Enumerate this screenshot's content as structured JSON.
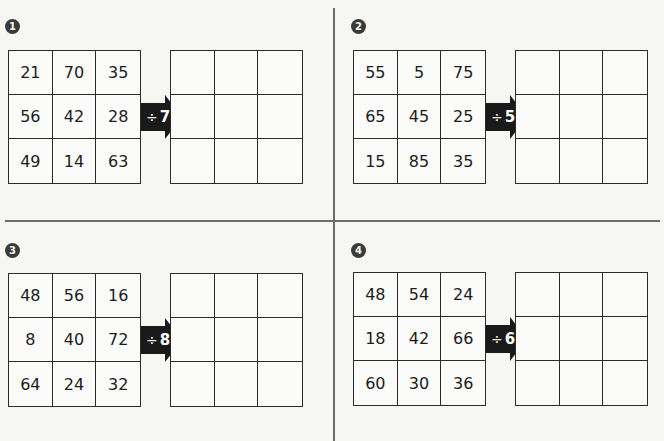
{
  "page": {
    "top_heading_fragment": ""
  },
  "colors": {
    "background": "#f6f6f3",
    "grid_line": "#2b2b2b",
    "badge": "#3a3a3a",
    "arrow": "#1a1a1a",
    "divider": "#6d6d6d"
  },
  "exercises": [
    {
      "number": "1",
      "operator": "÷",
      "divisor": "7",
      "input_grid": [
        [
          "21",
          "70",
          "35"
        ],
        [
          "56",
          "42",
          "28"
        ],
        [
          "49",
          "14",
          "63"
        ]
      ],
      "answer_grid": [
        [
          "",
          "",
          ""
        ],
        [
          "",
          "",
          ""
        ],
        [
          "",
          "",
          ""
        ]
      ]
    },
    {
      "number": "2",
      "operator": "÷",
      "divisor": "5",
      "input_grid": [
        [
          "55",
          "5",
          "75"
        ],
        [
          "65",
          "45",
          "25"
        ],
        [
          "15",
          "85",
          "35"
        ]
      ],
      "answer_grid": [
        [
          "",
          "",
          ""
        ],
        [
          "",
          "",
          ""
        ],
        [
          "",
          "",
          ""
        ]
      ]
    },
    {
      "number": "3",
      "operator": "÷",
      "divisor": "8",
      "input_grid": [
        [
          "48",
          "56",
          "16"
        ],
        [
          "8",
          "40",
          "72"
        ],
        [
          "64",
          "24",
          "32"
        ]
      ],
      "answer_grid": [
        [
          "",
          "",
          ""
        ],
        [
          "",
          "",
          ""
        ],
        [
          "",
          "",
          ""
        ]
      ]
    },
    {
      "number": "4",
      "operator": "÷",
      "divisor": "6",
      "input_grid": [
        [
          "48",
          "54",
          "24"
        ],
        [
          "18",
          "42",
          "66"
        ],
        [
          "60",
          "30",
          "36"
        ]
      ],
      "answer_grid": [
        [
          "",
          "",
          ""
        ],
        [
          "",
          "",
          ""
        ],
        [
          "",
          "",
          ""
        ]
      ]
    }
  ]
}
